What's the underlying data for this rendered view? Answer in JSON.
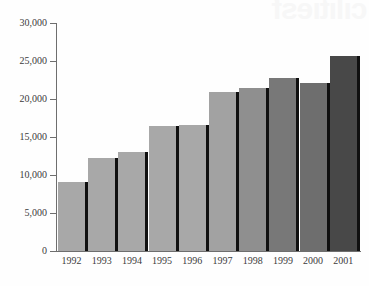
{
  "watermark": {
    "text": "cilitiesf",
    "visible": true
  },
  "chart_data": {
    "type": "bar",
    "title": "",
    "subtitle": "",
    "xlabel": "",
    "ylabel": "",
    "categories": [
      "1992",
      "1993",
      "1994",
      "1995",
      "1996",
      "1997",
      "1998",
      "1999",
      "2000",
      "2001"
    ],
    "values": [
      9100,
      12300,
      13000,
      16400,
      16600,
      20900,
      21500,
      22700,
      22100,
      25600
    ],
    "series": [
      {
        "name": "",
        "values": [
          9100,
          12300,
          13000,
          16400,
          16600,
          20900,
          21500,
          22700,
          22100,
          25600
        ]
      }
    ],
    "bar_colors": [
      "#a8a8a8",
      "#a8a8a8",
      "#a8a8a8",
      "#a8a8a8",
      "#a8a8a8",
      "#a2a2a2",
      "#8f8f8f",
      "#787878",
      "#6e6e6e",
      "#484848"
    ],
    "bar_shadow_color": "#101010",
    "ylim": [
      0,
      30000
    ],
    "y_ticks": [
      0,
      5000,
      10000,
      15000,
      20000,
      25000,
      30000
    ],
    "y_tick_labels": [
      "0",
      "5,000",
      "10,000",
      "15,000",
      "20,000",
      "25,000",
      "30,000"
    ],
    "grid": false,
    "legend": false,
    "axis_color": "#6e6e6e",
    "background_color": "#fefefe"
  }
}
